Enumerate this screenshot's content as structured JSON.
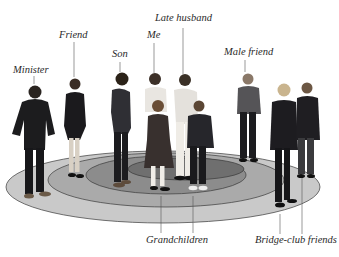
{
  "diagram": {
    "type": "concentric-circles-social-network",
    "colors": {
      "background": "#ffffff",
      "ring_outer": "#c9c9c9",
      "ring_second": "#aaaaaa",
      "ring_third": "#8c8c8c",
      "ring_inner": "#6f6f6f",
      "ring_stroke": "#3a3a3a",
      "leader_line": "#555555",
      "label_text": "#2a2a2a"
    },
    "labels": {
      "minister": "Minister",
      "friend": "Friend",
      "son": "Son",
      "me": "Me",
      "late_husband": "Late husband",
      "male_friend": "Male friend",
      "grandchildren": "Grandchildren",
      "bridge_club_friends": "Bridge-club friends"
    },
    "rings": [
      {
        "name": "outer",
        "members": [
          "Minister",
          "Bridge-club friends"
        ]
      },
      {
        "name": "second",
        "members": [
          "Friend",
          "Male friend"
        ]
      },
      {
        "name": "third",
        "members": [
          "Son",
          "Grandchildren"
        ]
      },
      {
        "name": "inner",
        "members": [
          "Me",
          "Late husband"
        ]
      }
    ]
  }
}
